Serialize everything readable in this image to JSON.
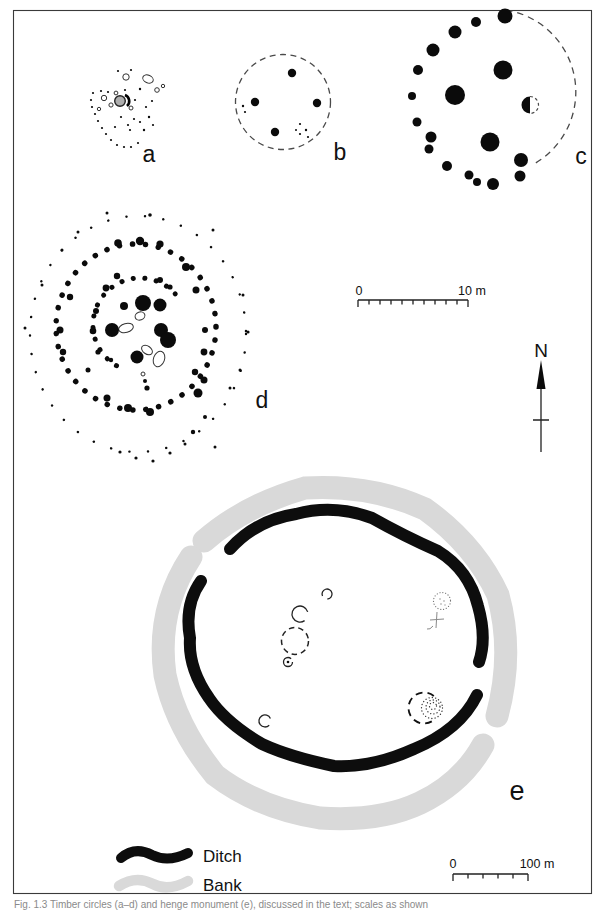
{
  "figure": {
    "panel_labels": {
      "a": "a",
      "b": "b",
      "c": "c",
      "d": "d",
      "e": "e"
    },
    "north_label": "N",
    "scale_bar_upper": {
      "start": "0",
      "end": "10 m"
    },
    "scale_bar_lower": {
      "start": "0",
      "end": "100 m"
    },
    "legend": {
      "ditch_label": "Ditch",
      "bank_label": "Bank"
    },
    "caption": "Fig. 1.3  Timber circles (a–d) and henge monument (e), discussed in the text; scales as shown",
    "colors": {
      "ditch": "#0d0d0d",
      "bank": "#d9d9d9",
      "posthole": "#0b0b0b",
      "dashed_outline": "#4a4a4a",
      "frame": "#3a3a3a"
    }
  }
}
